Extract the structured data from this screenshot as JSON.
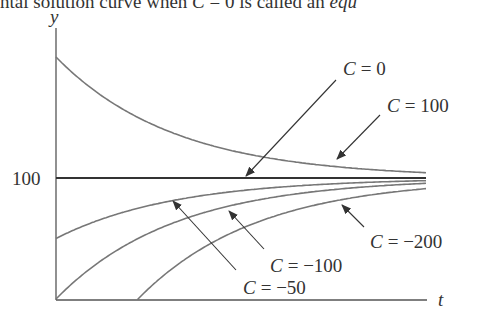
{
  "caption": {
    "text_plain": "ntal solution curve when ",
    "text_c": "C",
    "text_mid": " = 0 is called an ",
    "text_italic": "equ"
  },
  "chart_data": {
    "type": "line",
    "title": "",
    "xlabel": "t",
    "ylabel": "y",
    "model": "y = 100 + C·e^(-kt)",
    "yticks": [
      {
        "value": 100,
        "label": "100"
      }
    ],
    "equilibrium": 100,
    "series": [
      {
        "name": "C = 100",
        "C": 100,
        "y0": 200
      },
      {
        "name": "C = 0",
        "C": 0,
        "y0": 100
      },
      {
        "name": "C = -50",
        "C": -50,
        "y0": 50
      },
      {
        "name": "C = -100",
        "C": -100,
        "y0": 0
      },
      {
        "name": "C = -200",
        "C": -200,
        "y0": -100
      }
    ],
    "annotations": [
      {
        "label_var": "C",
        "label_val": "= 0"
      },
      {
        "label_var": "C",
        "label_val": "= 100"
      },
      {
        "label_var": "C",
        "label_val": "= −200"
      },
      {
        "label_var": "C",
        "label_val": "= −100"
      },
      {
        "label_var": "C",
        "label_val": "= −50"
      }
    ],
    "grid": false,
    "legend": "none (arrow annotations)"
  },
  "style": {
    "curve_color": "#777777",
    "axis_color": "#444444",
    "equilibrium_color": "#333333"
  }
}
